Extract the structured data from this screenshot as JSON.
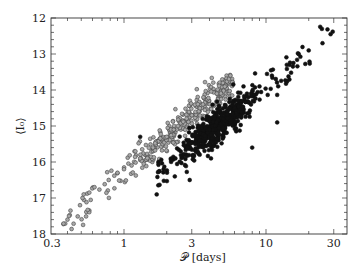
{
  "chart_data": {
    "type": "scatter",
    "title": "",
    "xlabel": "𝒫 [days]",
    "ylabel": "⟨I₀⟩",
    "x_scale": "log",
    "xlim": [
      0.3,
      37
    ],
    "ylim": [
      18,
      12
    ],
    "y_inverted": true,
    "x_ticks": [
      0.3,
      1,
      3,
      10,
      30
    ],
    "x_tick_labels": [
      "0.3",
      "1",
      "3",
      "10",
      "30"
    ],
    "y_ticks": [
      12,
      13,
      14,
      15,
      16,
      17,
      18
    ],
    "y_tick_labels": [
      "12",
      "13",
      "14",
      "15",
      "16",
      "17",
      "18"
    ],
    "grid": false,
    "legend": null,
    "series": [
      {
        "name": "gray sequence (open/gray circles)",
        "marker": "circle",
        "fill": "#a8a8a8",
        "stroke": "#444444",
        "relation": "I = 16.28 - 3.29 log10(P)",
        "period_range_days": [
          0.37,
          5.8
        ],
        "magnitude_range": [
          17.65,
          13.75
        ],
        "approx_count": 330,
        "scatter_mag": 0.22,
        "sample_points": [
          [
            0.4,
            17.6
          ],
          [
            0.41,
            17.5
          ],
          [
            0.42,
            17.35
          ],
          [
            0.49,
            17.2
          ],
          [
            0.51,
            17.0
          ],
          [
            0.52,
            16.9
          ],
          [
            0.57,
            16.85
          ],
          [
            0.62,
            16.7
          ],
          [
            0.78,
            16.5
          ],
          [
            0.9,
            16.3
          ],
          [
            1.0,
            16.2
          ],
          [
            1.3,
            15.9
          ],
          [
            1.6,
            15.6
          ],
          [
            2.0,
            15.3
          ],
          [
            2.4,
            15.0
          ],
          [
            3.0,
            14.7
          ],
          [
            3.6,
            14.4
          ],
          [
            4.5,
            14.1
          ],
          [
            5.8,
            13.78
          ]
        ]
      },
      {
        "name": "black sequence (filled circles)",
        "marker": "circle",
        "fill": "#111111",
        "stroke": "#111111",
        "relation": "I = 17.04 - 3.08 log10(P)",
        "period_range_days": [
          1.7,
          29
        ],
        "magnitude_range": [
          16.9,
          12.4
        ],
        "approx_count": 560,
        "scatter_mag": 0.25,
        "sample_points": [
          [
            1.9,
            16.2
          ],
          [
            2.3,
            15.9
          ],
          [
            2.8,
            15.6
          ],
          [
            3.4,
            15.4
          ],
          [
            4.0,
            15.1
          ],
          [
            5.0,
            14.8
          ],
          [
            6.0,
            14.5
          ],
          [
            7.5,
            14.2
          ],
          [
            9.0,
            13.9
          ],
          [
            11.0,
            13.6
          ],
          [
            14.0,
            13.3
          ],
          [
            17.0,
            13.0
          ],
          [
            20.0,
            12.9
          ],
          [
            25.0,
            12.7
          ],
          [
            28.5,
            12.45
          ],
          [
            29.5,
            12.38
          ]
        ],
        "outliers": [
          [
            1.7,
            16.9
          ],
          [
            2.9,
            16.5
          ],
          [
            4.1,
            15.9
          ],
          [
            1.3,
            15.3
          ],
          [
            8.0,
            15.6
          ],
          [
            12.0,
            14.9
          ]
        ]
      }
    ]
  },
  "render": {
    "width": 364,
    "height": 275,
    "plot_left": 51,
    "plot_right": 347,
    "plot_top": 18,
    "plot_bottom": 234,
    "px_per_decade": 142,
    "x_origin_px_at_P1": 124,
    "px_per_mag": 36,
    "axis_color": "#333333",
    "seed": 7
  }
}
